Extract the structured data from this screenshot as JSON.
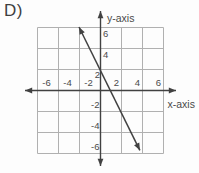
{
  "question_label": "D)",
  "chart_data": {
    "type": "line",
    "title": "",
    "xlabel": "x-axis",
    "ylabel": "y-axis",
    "grid": true,
    "grid_range": [
      -6,
      6
    ],
    "grid_step": 2,
    "xlim": [
      -7,
      7
    ],
    "ylim": [
      -7,
      7
    ],
    "x_ticks": [
      -6,
      -4,
      -2,
      2,
      4,
      6
    ],
    "y_ticks": [
      6,
      4,
      2,
      -2,
      -4,
      -6
    ],
    "series": [
      {
        "name": "plotted-line",
        "equation": "y = -2x + 2",
        "slope": -2,
        "y_intercept": 2,
        "x_intercept": 1,
        "points_on_line": [
          [
            -2,
            6
          ],
          [
            -1,
            4
          ],
          [
            0,
            2
          ],
          [
            1,
            0
          ],
          [
            2,
            -2
          ],
          [
            3,
            -4
          ]
        ],
        "segment": [
          [
            -2.05,
            6.05
          ],
          [
            3.75,
            -5.7
          ]
        ],
        "arrows": "both"
      }
    ],
    "colors": {
      "grid": "#b0b0b0",
      "axis": "#414141",
      "line": "#414141",
      "text": "#4a4a4a",
      "background": "#fdfdfd"
    }
  }
}
